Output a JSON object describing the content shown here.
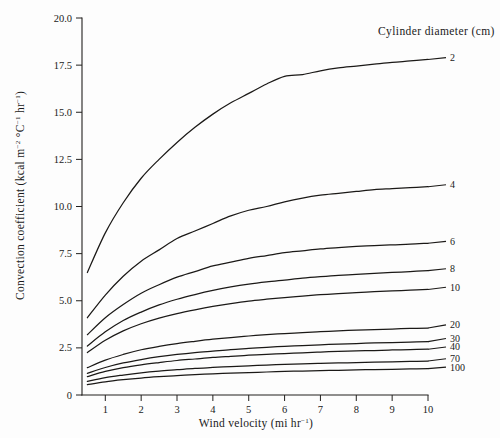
{
  "figure": {
    "background_color": "#fdfdfd",
    "ink_color": "#1b1917"
  },
  "axes": {
    "x": {
      "label_main": "Wind velocity (mi hr",
      "label_sup": "−1",
      "label_tail": ")",
      "label_full": "Wind velocity (mi hr−1)",
      "ticks": [
        "1",
        "2",
        "3",
        "4",
        "5",
        "6",
        "7",
        "8",
        "9",
        "10"
      ],
      "min": 0.35,
      "max": 10.0
    },
    "y": {
      "label_p1": "Convection coefficient (kcal m",
      "label_s1": "−2",
      "label_p2": " °C",
      "label_s2": "−1",
      "label_p3": " hr",
      "label_s3": "−1",
      "label_p4": ")",
      "label_full": "Convection coefficient (kcal m−2 °C−1 hr−1)",
      "ticks": [
        "0",
        "2.5",
        "5.0",
        "7.5",
        "10.0",
        "12.5",
        "15.0",
        "17.5",
        "20.0"
      ],
      "min": 0,
      "max": 20
    }
  },
  "legend": {
    "title": "Cylinder diameter (cm)",
    "position": "right-of-curve-ends"
  },
  "chart_data": {
    "type": "line",
    "title": "",
    "xlabel": "Wind velocity (mi hr−1)",
    "ylabel": "Convection coefficient (kcal m−2 °C−1 hr−1)",
    "xlim": [
      0.35,
      10.0
    ],
    "ylim": [
      0,
      20
    ],
    "xticks": [
      1,
      2,
      3,
      4,
      5,
      6,
      7,
      8,
      9,
      10
    ],
    "yticks": [
      0,
      2.5,
      5.0,
      7.5,
      10.0,
      12.5,
      15.0,
      17.5,
      20.0
    ],
    "grid": false,
    "legend_title": "Cylinder diameter (cm)",
    "x": [
      0.5,
      1,
      1.5,
      2,
      2.5,
      3,
      3.5,
      4,
      4.5,
      5,
      5.5,
      6,
      6.5,
      7,
      7.5,
      8,
      8.5,
      9,
      9.5,
      10
    ],
    "series": [
      {
        "name": "2",
        "label": "2",
        "values": [
          6.5,
          8.6,
          10.2,
          11.5,
          12.5,
          13.4,
          14.2,
          14.9,
          15.5,
          16.0,
          16.5,
          16.9,
          17.0,
          17.2,
          17.35,
          17.45,
          17.55,
          17.65,
          17.72,
          17.8
        ]
      },
      {
        "name": "4",
        "label": "4",
        "values": [
          4.1,
          5.3,
          6.3,
          7.1,
          7.7,
          8.3,
          8.7,
          9.1,
          9.5,
          9.8,
          10.0,
          10.25,
          10.45,
          10.6,
          10.7,
          10.8,
          10.9,
          10.95,
          11.0,
          11.05
        ]
      },
      {
        "name": "6",
        "label": "6",
        "values": [
          3.2,
          4.1,
          4.8,
          5.4,
          5.85,
          6.25,
          6.55,
          6.85,
          7.05,
          7.25,
          7.4,
          7.55,
          7.65,
          7.75,
          7.82,
          7.88,
          7.93,
          7.97,
          8.0,
          8.05
        ]
      },
      {
        "name": "8",
        "label": "8",
        "values": [
          2.6,
          3.35,
          3.95,
          4.4,
          4.78,
          5.08,
          5.33,
          5.55,
          5.73,
          5.88,
          6.0,
          6.1,
          6.2,
          6.28,
          6.35,
          6.4,
          6.45,
          6.5,
          6.55,
          6.6
        ]
      },
      {
        "name": "10",
        "label": "10",
        "values": [
          2.25,
          2.9,
          3.4,
          3.78,
          4.08,
          4.32,
          4.52,
          4.7,
          4.85,
          4.98,
          5.08,
          5.17,
          5.25,
          5.32,
          5.38,
          5.43,
          5.48,
          5.52,
          5.56,
          5.6
        ]
      },
      {
        "name": "20",
        "label": "20",
        "values": [
          1.45,
          1.85,
          2.15,
          2.4,
          2.58,
          2.73,
          2.85,
          2.96,
          3.05,
          3.13,
          3.2,
          3.26,
          3.31,
          3.36,
          3.4,
          3.44,
          3.47,
          3.5,
          3.53,
          3.55
        ]
      },
      {
        "name": "30",
        "label": "30",
        "values": [
          1.15,
          1.46,
          1.7,
          1.88,
          2.03,
          2.15,
          2.25,
          2.33,
          2.41,
          2.47,
          2.53,
          2.58,
          2.62,
          2.66,
          2.7,
          2.73,
          2.76,
          2.78,
          2.81,
          2.83
        ]
      },
      {
        "name": "40",
        "label": "40",
        "values": [
          0.98,
          1.25,
          1.45,
          1.6,
          1.72,
          1.83,
          1.91,
          1.99,
          2.05,
          2.11,
          2.16,
          2.2,
          2.24,
          2.28,
          2.31,
          2.34,
          2.36,
          2.39,
          2.41,
          2.43
        ]
      },
      {
        "name": "70",
        "label": "70",
        "values": [
          0.72,
          0.92,
          1.06,
          1.18,
          1.27,
          1.34,
          1.41,
          1.46,
          1.51,
          1.55,
          1.59,
          1.62,
          1.65,
          1.68,
          1.7,
          1.72,
          1.74,
          1.76,
          1.78,
          1.8
        ]
      },
      {
        "name": "100",
        "label": "100",
        "values": [
          0.55,
          0.7,
          0.81,
          0.9,
          0.97,
          1.03,
          1.08,
          1.12,
          1.16,
          1.19,
          1.22,
          1.25,
          1.27,
          1.29,
          1.31,
          1.33,
          1.35,
          1.36,
          1.38,
          1.4
        ]
      }
    ],
    "series_label_anchor_y": [
      17.9,
      11.15,
      8.15,
      6.7,
      5.72,
      3.72,
      3.0,
      2.55,
      1.92,
      1.48
    ]
  }
}
